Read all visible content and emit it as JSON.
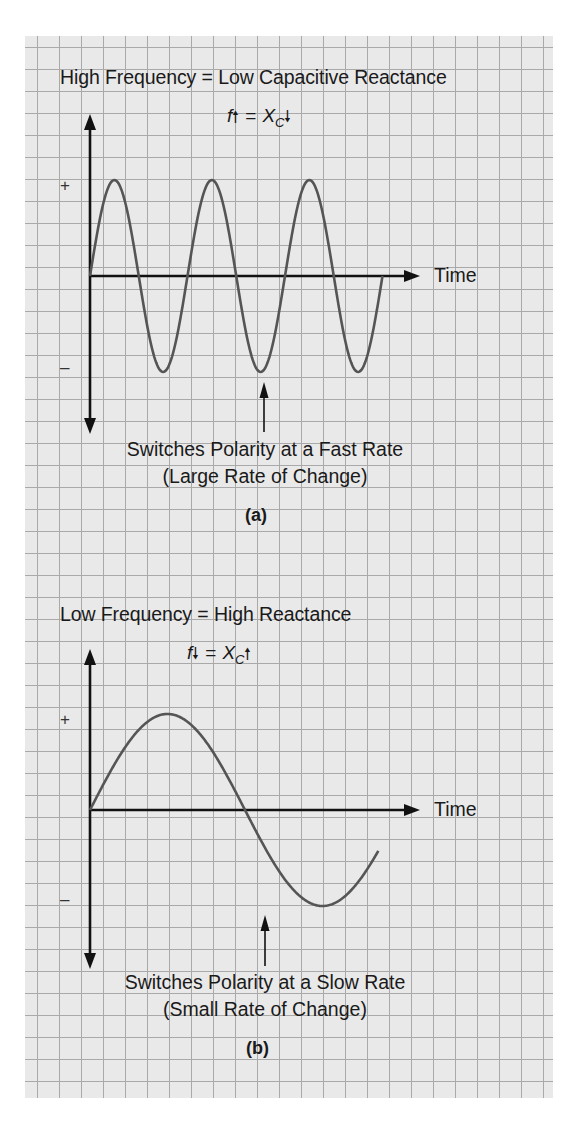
{
  "panels": {
    "a": {
      "title": "High Frequency = Low Capacitive Reactance",
      "formula": {
        "left": "f",
        "left_arrow": "up",
        "right_base": "X",
        "right_sub": "C",
        "right_arrow": "down",
        "equals": "="
      },
      "axis_label_time": "Time",
      "sign_positive": "+",
      "sign_negative": "–",
      "annotation_line1": "Switches Polarity at a Fast Rate",
      "annotation_line2": "(Large Rate of Change)",
      "panel_label": "(a)"
    },
    "b": {
      "title": "Low Frequency = High Reactance",
      "formula": {
        "left": "f",
        "left_arrow": "down",
        "right_base": "X",
        "right_sub": "C",
        "right_arrow": "up",
        "equals": "="
      },
      "axis_label_time": "Time",
      "sign_positive": "+",
      "sign_negative": "–",
      "annotation_line1": "Switches Polarity at a Slow Rate",
      "annotation_line2": "(Small Rate of Change)",
      "panel_label": "(b)"
    }
  },
  "colors": {
    "grid_background": "#e9e9e9",
    "grid_lines": "#a9a9a9",
    "axis": "#111111",
    "waveform": "#555555",
    "text": "#1a1a1a"
  },
  "chart_data": [
    {
      "type": "line",
      "title": "High Frequency = Low Capacitive Reactance",
      "subtitle": "f↑ = Xc↓",
      "xlabel": "Time",
      "ylabel": "",
      "y_markers": [
        "+",
        "–"
      ],
      "waveform": "sine",
      "cycles": 3,
      "amplitude": 1,
      "annotation": "Switches Polarity at a Fast Rate (Large Rate of Change)",
      "annotation_target": "second negative peak",
      "panel": "(a)",
      "grid": true
    },
    {
      "type": "line",
      "title": "Low Frequency = High Reactance",
      "subtitle": "f↓ = Xc↑",
      "xlabel": "Time",
      "ylabel": "",
      "y_markers": [
        "+",
        "–"
      ],
      "waveform": "sine",
      "cycles": 0.93,
      "amplitude": 1,
      "annotation": "Switches Polarity at a Slow Rate (Small Rate of Change)",
      "annotation_target": "negative peak",
      "panel": "(b)",
      "grid": true
    }
  ]
}
